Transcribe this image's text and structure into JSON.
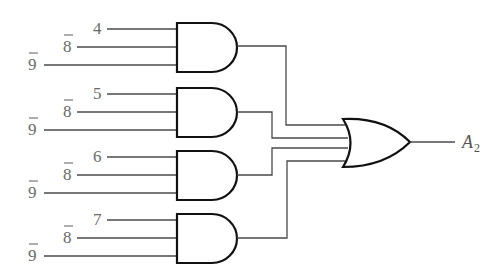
{
  "diagram": {
    "type": "logic-circuit",
    "and_gates": [
      {
        "id": "and-1",
        "inputs": [
          {
            "label": "4",
            "negated": false
          },
          {
            "label": "8",
            "negated": true
          },
          {
            "label": "9",
            "negated": true
          }
        ]
      },
      {
        "id": "and-2",
        "inputs": [
          {
            "label": "5",
            "negated": false
          },
          {
            "label": "8",
            "negated": true
          },
          {
            "label": "9",
            "negated": true
          }
        ]
      },
      {
        "id": "and-3",
        "inputs": [
          {
            "label": "6",
            "negated": false
          },
          {
            "label": "8",
            "negated": true
          },
          {
            "label": "9",
            "negated": true
          }
        ]
      },
      {
        "id": "and-4",
        "inputs": [
          {
            "label": "7",
            "negated": false
          },
          {
            "label": "8",
            "negated": true
          },
          {
            "label": "9",
            "negated": true
          }
        ]
      }
    ],
    "or_gate": {
      "id": "or-1",
      "inputs": [
        "and-1",
        "and-2",
        "and-3",
        "and-4"
      ]
    },
    "output": {
      "label": "A",
      "subscript": "2"
    },
    "colors": {
      "wire": "#4a4a4a",
      "gate_outline": "#111111",
      "label": "#6a6a6a"
    }
  }
}
